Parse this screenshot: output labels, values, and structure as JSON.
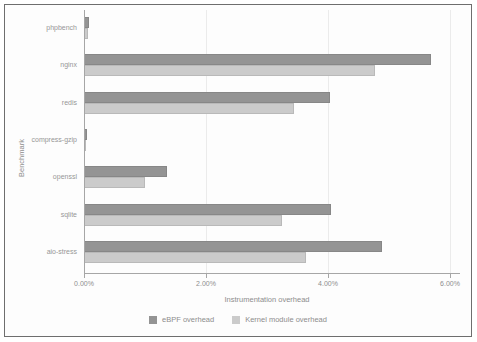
{
  "chart_data": {
    "type": "bar",
    "orientation": "horizontal",
    "title": "",
    "xlabel": "Instrumentation overhead",
    "ylabel": "Benchmark",
    "categories": [
      "phpbench",
      "nginx",
      "redis",
      "compress-gzip",
      "openssl",
      "sqlite",
      "aio-stress"
    ],
    "series": [
      {
        "name": "eBPF overhead",
        "color": "#949494",
        "values": [
          0.07,
          5.67,
          4.02,
          0.03,
          1.35,
          4.03,
          4.87
        ]
      },
      {
        "name": "Kernel module overhead",
        "color": "#cbcbcb",
        "values": [
          0.05,
          4.75,
          3.43,
          0.02,
          0.98,
          3.23,
          3.63
        ]
      }
    ],
    "value_unit": "%",
    "xlim": [
      0,
      6
    ],
    "xticks": [
      0,
      2,
      4,
      6
    ],
    "xtick_labels": [
      "0.00%",
      "2.00%",
      "4.00%",
      "6.00%"
    ],
    "grid": true,
    "legend_position": "bottom"
  },
  "colors": {
    "frame_border": "#6e6e6e",
    "axis": "#a6a6a6",
    "gridline": "#ebebeb",
    "text": "#8d8d8d",
    "background": "#fdfdfd"
  }
}
